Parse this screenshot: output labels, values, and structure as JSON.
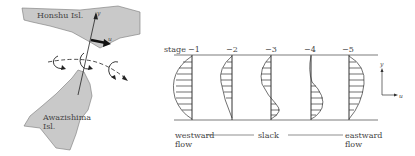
{
  "map": {
    "honshu_label": "Honshu Isl.",
    "awaji_label_line1": "Awazishima",
    "awaji_label_line2": "Isl.",
    "axis_y": "y",
    "axis_u": "u"
  },
  "profiles": {
    "stage_prefix": "stage",
    "stages": [
      "−1",
      "−2",
      "−3",
      "−4",
      "−5"
    ],
    "axis_y": "y",
    "axis_u": "u",
    "bottom": {
      "westward_line1": "westward",
      "westward_line2": "flow",
      "slack": "slack",
      "eastward_line1": "eastward",
      "eastward_line2": "flow"
    }
  },
  "colors": {
    "land": "#c8c8c8",
    "ink": "#333333"
  }
}
